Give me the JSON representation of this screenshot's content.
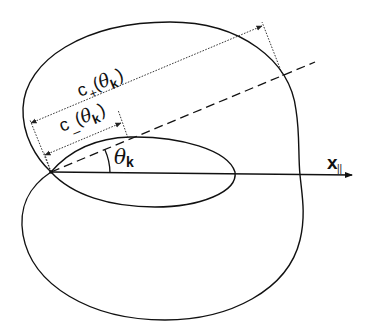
{
  "diagram": {
    "labels": {
      "c_plus": {
        "base": "c",
        "sub": "+",
        "open_paren": "(",
        "theta": "θ",
        "theta_sub": "k",
        "close_paren": ")"
      },
      "c_minus": {
        "base": "c",
        "sub": "_",
        "open_paren": "(",
        "theta": "θ",
        "theta_sub": "k",
        "close_paren": ")"
      },
      "angle": {
        "theta": "θ",
        "theta_sub": "k"
      },
      "axis": {
        "base": "x",
        "sub": "||"
      }
    },
    "elements": {
      "outer_curve": "outer wave surface (two-lobed)",
      "inner_lobe": "inner elliptical lobe",
      "direction_line": "dashed direction at angle theta_k",
      "x_axis": "x-parallel axis arrow"
    },
    "colors": {
      "stroke": "#111111",
      "background": "#ffffff"
    }
  }
}
